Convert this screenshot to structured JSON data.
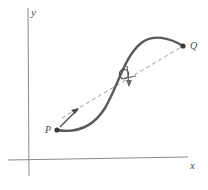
{
  "figure": {
    "kind": "math-diagram",
    "width": 208,
    "height": 190,
    "background": "#ffffff"
  },
  "axes": {
    "x_axis": {
      "label": "x",
      "label_x": 190,
      "label_y": 163,
      "line": {
        "x1": 8,
        "y1": 160,
        "x2": 188,
        "y2": 157
      },
      "color": "#8a8a8a",
      "width": 1
    },
    "y_axis": {
      "label": "y",
      "label_x": 31,
      "label_y": 12,
      "line": {
        "x1": 28,
        "y1": 8,
        "x2": 29,
        "y2": 176
      },
      "color": "#8a8a8a",
      "width": 1
    }
  },
  "curve": {
    "name": "function-curve",
    "color": "#5a5a5a",
    "width": 2.4,
    "path": "M 57 130 C 75 133 92 129 105 108 C 118 86 124 58 140 44 C 152 33 170 38 183 46",
    "style": "solid"
  },
  "secant": {
    "name": "secant-line-pq",
    "color": "#9a9a9a",
    "width": 1,
    "dash": "4 3",
    "from": {
      "x": 62,
      "y": 118
    },
    "to": {
      "x": 183,
      "y": 46
    },
    "arrow_tip": {
      "x": 78,
      "y": 109
    },
    "arrow_tail": {
      "x": 60,
      "y": 127
    },
    "style": "dashed"
  },
  "points": [
    {
      "id": "P",
      "label": "P",
      "label_x": 49,
      "label_y": 130,
      "dot_x": 57,
      "dot_y": 130,
      "radius": 2.6,
      "color": "#3a3a3a",
      "filled": true
    },
    {
      "id": "Q",
      "label": "Q",
      "label_x": 193,
      "label_y": 46,
      "dot_x": 183,
      "dot_y": 46,
      "radius": 2.6,
      "color": "#3a3a3a",
      "filled": true
    }
  ],
  "marker": {
    "name": "tangency-circle",
    "cx": 124,
    "cy": 74,
    "r": 4.6,
    "stroke": "#4a4a4a",
    "width": 1.3,
    "fill": "none"
  },
  "tangent_arrow": {
    "name": "tangent-arrow",
    "color": "#6a6a6a",
    "width": 1.2,
    "from": {
      "x": 127,
      "y": 67
    },
    "to": {
      "x": 129,
      "y": 85
    },
    "crossbar": {
      "x1": 122,
      "y1": 79,
      "x2": 136,
      "y2": 77
    }
  },
  "colors": {
    "curve": "#5a5a5a",
    "axis": "#8a8a8a",
    "secant": "#9a9a9a",
    "point": "#3a3a3a",
    "text": "#4a4a4a",
    "background": "#ffffff"
  }
}
